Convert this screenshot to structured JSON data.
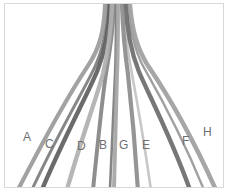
{
  "figure": {
    "width": 228,
    "height": 194,
    "background_color": "#ffffff",
    "border_color": "#d8d8d8",
    "label_color": "#6f6f6f"
  },
  "chart_data": {
    "type": "line",
    "title": "",
    "xlabel": "",
    "ylabel": "",
    "grid": false,
    "legend_position": "inline-labels",
    "series": [
      {
        "name": "A",
        "label": "A",
        "color": "#9a9a9a",
        "width": 4.2,
        "label_x": 18,
        "label_y": 127,
        "top_x": 101,
        "bottom_x": 8,
        "path": "M101,0 C100,26 96,44 84,62 C70,83 46,124 14,186"
      },
      {
        "name": "B",
        "label": "B",
        "color": "#848484",
        "width": 4.0,
        "label_x": 94,
        "label_y": 135,
        "top_x": 110,
        "bottom_x": 85,
        "path": "M110,0 C109,28 106,48 102,70 C98,96 94,136 89,186"
      },
      {
        "name": "C",
        "label": "C",
        "color": "#5e5e5e",
        "width": 4.4,
        "label_x": 40,
        "label_y": 134,
        "top_x": 106,
        "bottom_x": 36,
        "path": "M106,0 C105,28 101,48 93,68 C83,92 62,130 38,186"
      },
      {
        "name": "D",
        "label": "D",
        "color": "#b0b0b0",
        "width": 4.4,
        "label_x": 72,
        "label_y": 136,
        "top_x": 108,
        "bottom_x": 61,
        "path": "M108,0 C107,28 104,49 99,70 C92,96 78,133 63,186"
      },
      {
        "name": "E",
        "label": "E",
        "color": "#8c8c8c",
        "width": 4.2,
        "label_x": 137,
        "label_y": 135,
        "top_x": 118,
        "bottom_x": 131,
        "path": "M118,0 C119,28 121,49 124,70 C127,97 131,137 134,186"
      },
      {
        "name": "F",
        "label": "F",
        "color": "#6b6b6b",
        "width": 4.4,
        "label_x": 177,
        "label_y": 131,
        "top_x": 122,
        "bottom_x": 175,
        "path": "M122,0 C123,28 127,48 135,68 C146,94 166,131 186,186"
      },
      {
        "name": "G",
        "label": "G",
        "color": "#a4a4a4",
        "width": 4.0,
        "label_x": 114,
        "label_y": 135,
        "top_x": 114,
        "bottom_x": 108,
        "path": "M114,0 C114,28 114,50 113,72 C112,98 111,137 110,186"
      },
      {
        "name": "H",
        "label": "H",
        "color": "#9e9e9e",
        "width": 4.6,
        "label_x": 198,
        "label_y": 122,
        "top_x": 126,
        "bottom_x": 203,
        "path": "M126,0 C128,26 133,44 144,62 C159,84 184,124 212,186"
      }
    ],
    "accent_strands": [
      {
        "color": "#727272",
        "width": 3.0,
        "path": "M104,0 C103,26 99,46 90,65 C78,90 55,128 28,186"
      },
      {
        "color": "#707070",
        "width": 2.6,
        "path": "M112,0 C112,28 112,50 111,72 C110,100 108,140 106,186"
      },
      {
        "color": "#bdbdbd",
        "width": 2.6,
        "path": "M120,0 C121,28 124,49 128,70 C133,97 140,136 147,186"
      },
      {
        "color": "#8f8f8f",
        "width": 2.4,
        "path": "M124,0 C126,26 130,46 140,64 C153,87 176,127 200,186"
      }
    ]
  },
  "labels": [
    {
      "text": "A"
    },
    {
      "text": "C"
    },
    {
      "text": "D"
    },
    {
      "text": "B"
    },
    {
      "text": "G"
    },
    {
      "text": "E"
    },
    {
      "text": "F"
    },
    {
      "text": "H"
    }
  ]
}
